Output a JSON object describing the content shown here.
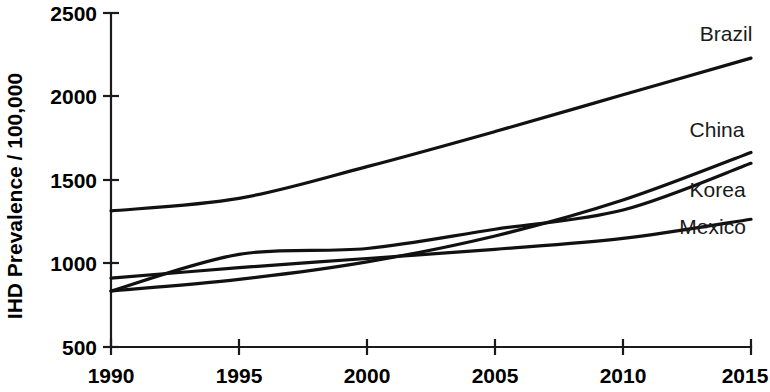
{
  "chart_data": {
    "type": "line",
    "title": "",
    "subtitle": "",
    "xlabel": "",
    "ylabel": "IHD Prevalence / 100,000",
    "xlim": [
      1990,
      2015
    ],
    "ylim": [
      500,
      2500
    ],
    "xticks": [
      1990,
      1995,
      2000,
      2005,
      2010,
      2015
    ],
    "yticks": [
      500,
      1000,
      1500,
      2000,
      2500
    ],
    "xtick_labels": [
      "1990",
      "1995",
      "2000",
      "2005",
      "2010",
      "2015"
    ],
    "ytick_labels": [
      "500",
      "1000",
      "1500",
      "2000",
      "2500"
    ],
    "grid": false,
    "legend_position": "inline-right-labels",
    "x": [
      1990,
      1995,
      2000,
      2005,
      2010,
      2015
    ],
    "series": [
      {
        "name": "Brazil",
        "label": "Brazil",
        "color": "#111111",
        "values": [
          1315,
          1390,
          1580,
          1790,
          2010,
          2230
        ],
        "label_point": {
          "x": 2013.0,
          "y": 2330
        }
      },
      {
        "name": "China",
        "label": "China",
        "color": "#111111",
        "values": [
          835,
          905,
          1010,
          1165,
          1380,
          1665
        ],
        "label_point": {
          "x": 2012.6,
          "y": 1755
        }
      },
      {
        "name": "Korea",
        "label": "Korea",
        "color": "#111111",
        "values": [
          835,
          1055,
          1090,
          1205,
          1320,
          1600
        ],
        "label_point": {
          "x": 2012.6,
          "y": 1400
        }
      },
      {
        "name": "Mexico",
        "label": "Mexico",
        "color": "#111111",
        "values": [
          912,
          975,
          1030,
          1085,
          1150,
          1265
        ],
        "label_point": {
          "x": 2012.2,
          "y": 1175
        }
      }
    ],
    "annotations": [
      "Brazil line rises steadily and is highest throughout.",
      "China and Korea start together at 1990 and cross near 2006.",
      "Mexico is lowest after 1995 and rises gradually."
    ]
  }
}
